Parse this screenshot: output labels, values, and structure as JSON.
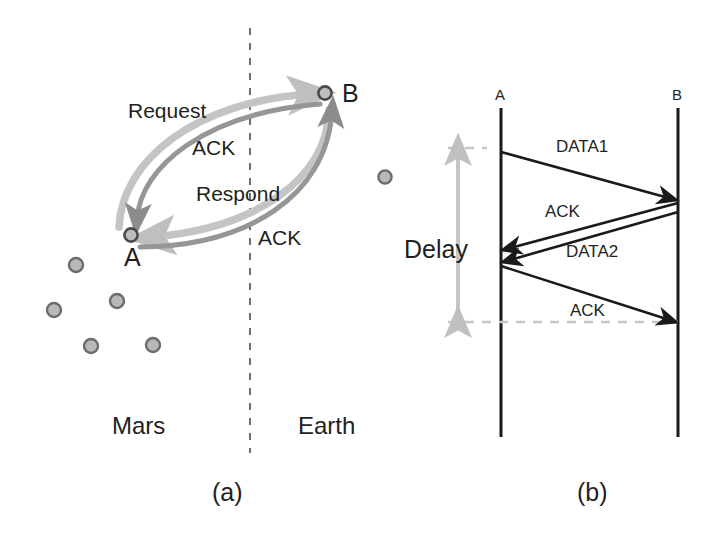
{
  "figure": {
    "panels": [
      {
        "id": "a",
        "caption": "(a)",
        "nodes": [
          {
            "name": "A",
            "label": "A",
            "x": 131,
            "y": 235
          },
          {
            "name": "B",
            "label": "B",
            "x": 325,
            "y": 93
          }
        ],
        "regions": [
          {
            "name": "left-region",
            "label": "Mars",
            "x": 112,
            "y": 427
          },
          {
            "name": "right-region",
            "label": "Earth",
            "x": 298,
            "y": 427
          }
        ],
        "divider": {
          "name": "mars-earth-divider",
          "style": "dashed-vertical",
          "x": 250,
          "y1": 28,
          "y2": 453
        },
        "messages": [
          {
            "name": "request-arrow",
            "label": "Request",
            "from": "A",
            "to": "B",
            "color": "#bfbfbf",
            "label_x": 128,
            "label_y": 100
          },
          {
            "name": "ack-arrow-1",
            "label": "ACK",
            "from": "B",
            "to": "A",
            "color": "#8c8c8c",
            "label_x": 192,
            "label_y": 137
          },
          {
            "name": "respond-arrow",
            "label": "Respond",
            "from": "B",
            "to": "A",
            "color": "#bfbfbf",
            "label_x": 196,
            "label_y": 184
          },
          {
            "name": "ack-arrow-2",
            "label": "ACK",
            "from": "A",
            "to": "B",
            "color": "#8c8c8c",
            "label_x": 258,
            "label_y": 229
          }
        ],
        "stars": [
          {
            "x": 76,
            "y": 265
          },
          {
            "x": 54,
            "y": 310
          },
          {
            "x": 117,
            "y": 301
          },
          {
            "x": 91,
            "y": 346
          },
          {
            "x": 153,
            "y": 345
          },
          {
            "x": 385,
            "y": 177
          }
        ]
      },
      {
        "id": "b",
        "caption": "(b)",
        "lifelines": [
          {
            "name": "lifeline-a",
            "label": "A",
            "x": 501,
            "y_top": 108,
            "y_bottom": 437
          },
          {
            "name": "lifeline-b",
            "label": "B",
            "x": 678,
            "y_top": 108,
            "y_bottom": 437
          }
        ],
        "messages": [
          {
            "name": "data1-arrow",
            "label": "DATA1",
            "from": "A",
            "to": "B",
            "y_start": 152,
            "y_end": 200,
            "label_x": 556,
            "label_y": 146
          },
          {
            "name": "ack-arrow-1",
            "label": "ACK",
            "from": "B",
            "to": "A",
            "y_start": 203,
            "y_end": 250,
            "label_x": 545,
            "label_y": 211
          },
          {
            "name": "data2-arrow",
            "label": "DATA2",
            "from": "B",
            "to": "A",
            "y_start": 212,
            "y_end": 262,
            "label_x": 566,
            "label_y": 250
          },
          {
            "name": "ack-arrow-2",
            "label": "ACK",
            "from": "A",
            "to": "B",
            "y_start": 266,
            "y_end": 322,
            "label_x": 570,
            "label_y": 310
          }
        ],
        "delay": {
          "name": "delay-measure",
          "label": "Delay",
          "label_x": 408,
          "label_y": 240,
          "arrow_x": 458,
          "y_top": 148,
          "y_bottom": 322,
          "color": "#bfbfbf",
          "guide_top": {
            "x1": 448,
            "x2": 487,
            "y": 148
          },
          "guide_bottom": {
            "x1": 448,
            "x2": 682,
            "y": 322
          }
        }
      }
    ],
    "colors": {
      "ink": "#231f20",
      "arrow_light": "#bfbfbf",
      "arrow_dark": "#8c8c8c",
      "star_fill": "#b3b3b3",
      "star_stroke": "#6d6d6d",
      "delay_gray": "#c0c0c0",
      "background": "#ffffff"
    }
  }
}
